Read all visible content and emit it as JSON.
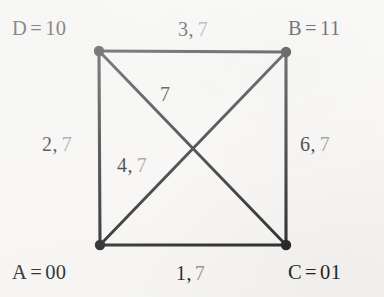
{
  "diagram": {
    "type": "graph",
    "background_color": "#f8f7f5",
    "ink_color": "#151515",
    "dim_ink_color": "#8d8d8d",
    "nodes": [
      {
        "id": "D",
        "name": "D",
        "separator": "=",
        "code": "10",
        "label": "D = 10",
        "corner": "top-left",
        "x": 99,
        "y": 51
      },
      {
        "id": "B",
        "name": "B",
        "separator": "=",
        "code": "11",
        "label": "B = 11",
        "corner": "top-right",
        "x": 286,
        "y": 52
      },
      {
        "id": "A",
        "name": "A",
        "separator": "=",
        "code": "00",
        "label": "A = 00",
        "corner": "bottom-left",
        "x": 100,
        "y": 245
      },
      {
        "id": "C",
        "name": "C",
        "separator": "=",
        "code": "01",
        "label": "C = 01",
        "corner": "bottom-right",
        "x": 286,
        "y": 245
      }
    ],
    "edges": [
      {
        "id": "DB",
        "from": "D",
        "to": "B",
        "position": "top",
        "weight": "3",
        "second": "7",
        "label": "3, 7"
      },
      {
        "id": "DA",
        "from": "D",
        "to": "A",
        "position": "left",
        "weight": "2",
        "second": "7",
        "label": "2, 7"
      },
      {
        "id": "BC",
        "from": "B",
        "to": "C",
        "position": "right",
        "weight": "6",
        "second": "7",
        "label": "6, 7"
      },
      {
        "id": "AC",
        "from": "A",
        "to": "C",
        "position": "bottom",
        "weight": "1",
        "second": "7",
        "label": "1, 7"
      },
      {
        "id": "DC",
        "from": "D",
        "to": "C",
        "position": "diagonal-nw-se",
        "weight": "7",
        "second": "",
        "label": "7"
      },
      {
        "id": "AB",
        "from": "A",
        "to": "B",
        "position": "diagonal-sw-ne",
        "weight": "4",
        "second": "7",
        "label": "4, 7"
      }
    ]
  },
  "labels": {
    "node_d": {
      "name": "D",
      "eq": "=",
      "code": "10"
    },
    "node_b": {
      "name": "B",
      "eq": "=",
      "code": "11"
    },
    "node_a": {
      "name": "A",
      "eq": "=",
      "code": "00"
    },
    "node_c": {
      "name": "C",
      "eq": "=",
      "code": "01"
    },
    "edge_top": {
      "primary": "3,",
      "secondary": "7"
    },
    "edge_left": {
      "primary": "2,",
      "secondary": "7"
    },
    "edge_right": {
      "primary": "6,",
      "secondary": "7"
    },
    "edge_bottom": {
      "primary": "1,",
      "secondary": "7"
    },
    "edge_diag_top": {
      "primary": "7",
      "secondary": ""
    },
    "edge_diag_mid": {
      "primary": "4,",
      "secondary": "7"
    }
  }
}
